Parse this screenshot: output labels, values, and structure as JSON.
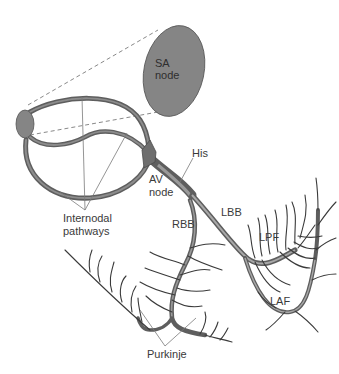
{
  "diagram": {
    "colors": {
      "node_fill": "#858585",
      "tract_stroke": "#5e5e5e",
      "fiber_stroke": "#3a3a3a",
      "label_color": "#3a3a3a"
    },
    "labels": {
      "sa_line1": "SA",
      "sa_line2": "node",
      "av_line1": "AV",
      "av_line2": "node",
      "his": "His",
      "rbb": "RBB",
      "lbb": "LBB",
      "lpf": "LPF",
      "laf": "LAF",
      "internodal_line1": "Internodal",
      "internodal_line2": "pathways",
      "purkinje": "Purkinje"
    },
    "nodes": [
      {
        "id": "sa-node-enlarged",
        "label": "SA node"
      },
      {
        "id": "sa-node",
        "label": ""
      },
      {
        "id": "av-node",
        "label": "AV node"
      }
    ],
    "edges": [
      {
        "from": "sa-node",
        "to": "av-node",
        "label": "Internodal pathways"
      },
      {
        "from": "av-node",
        "to": "his",
        "label": "His"
      },
      {
        "from": "his",
        "to": "rbb",
        "label": "RBB"
      },
      {
        "from": "his",
        "to": "lbb",
        "label": "LBB"
      },
      {
        "from": "lbb",
        "to": "lpf",
        "label": "LPF"
      },
      {
        "from": "lbb",
        "to": "laf",
        "label": "LAF"
      },
      {
        "from": "rbb",
        "to": "purkinje",
        "label": "Purkinje"
      }
    ]
  }
}
